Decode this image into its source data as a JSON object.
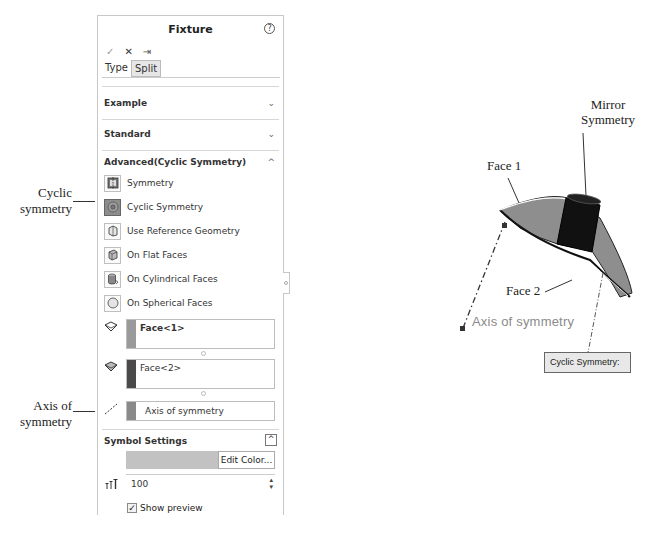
{
  "panel": {
    "title": "Fixture",
    "help_icon": "help-icon",
    "toolbar": {
      "ok": "✓",
      "cancel": "✕",
      "pin": "⇥"
    },
    "tabs": [
      {
        "label": "Type",
        "active": false
      },
      {
        "label": "Split",
        "active": true
      }
    ],
    "sections": {
      "example": {
        "label": "Example",
        "chevron": "⌄"
      },
      "standard": {
        "label": "Standard",
        "chevron": "⌄"
      },
      "advanced": {
        "label": "Advanced(Cyclic Symmetry)",
        "chevron": "^"
      }
    },
    "options": [
      {
        "label": "Symmetry",
        "icon": "symmetry-icon",
        "selected": false
      },
      {
        "label": "Cyclic Symmetry",
        "icon": "cyclic-symmetry-icon",
        "selected": true
      },
      {
        "label": "Use Reference Geometry",
        "icon": "reference-geometry-icon",
        "selected": false
      },
      {
        "label": "On Flat Faces",
        "icon": "flat-faces-icon",
        "selected": false
      },
      {
        "label": "On Cylindrical Faces",
        "icon": "cylindrical-faces-icon",
        "selected": false
      },
      {
        "label": "On Spherical Faces",
        "icon": "spherical-faces-icon",
        "selected": false
      }
    ],
    "selections": [
      {
        "value": "Face<1>",
        "swatch": "#9a9a9a",
        "icon": "face-icon"
      },
      {
        "value": "Face<2>",
        "swatch": "#4a4a4a",
        "icon": "face-icon"
      },
      {
        "value": "Axis of symmetry",
        "swatch": "#8a8a8a",
        "icon": "axis-icon"
      }
    ],
    "symbol_settings": {
      "label": "Symbol Settings",
      "collapse": "^",
      "edit_color_label": "Edit Color...",
      "symbol_size": "100",
      "show_preview_label": "Show preview",
      "show_preview_checked": true,
      "color_swatch": "#c2c2c2"
    }
  },
  "annotations": {
    "cyclic_symmetry": [
      "Cyclic",
      "symmetry"
    ],
    "axis_of_symmetry": [
      "Axis of",
      "symmetry"
    ]
  },
  "graphic": {
    "mirror_symmetry": [
      "Mirror",
      "Symmetry"
    ],
    "face1": "Face 1",
    "face2": "Face 2",
    "axis_label": "Axis of symmetry",
    "cyclic_box_label": "Cyclic Symmetry:"
  }
}
